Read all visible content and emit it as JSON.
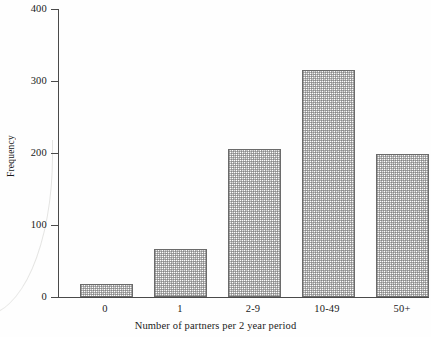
{
  "chart_data": {
    "type": "bar",
    "title": "",
    "xlabel": "Number of partners per 2 year period",
    "ylabel": "Frequency",
    "categories": [
      "0",
      "1",
      "2-9",
      "10-49",
      "50+"
    ],
    "values": [
      18,
      67,
      205,
      315,
      198
    ],
    "ylim": [
      0,
      400
    ],
    "yticks": [
      0,
      100,
      200,
      300,
      400
    ],
    "ytick_labels": [
      "0",
      "100",
      "200",
      "300",
      "400"
    ],
    "grid": false,
    "legend": null,
    "bar_fill": "#c9c9c9",
    "bar_edge": "#6b6b6b",
    "axis_color": "#4a4a4a",
    "background": "#fefefe"
  }
}
